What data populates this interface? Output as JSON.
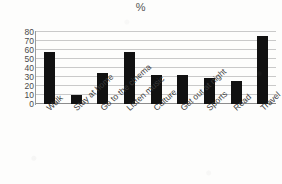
{
  "chart_data": {
    "type": "bar",
    "title": "%",
    "xlabel": "",
    "ylabel": "",
    "ylim": [
      0,
      80
    ],
    "yticks": [
      0,
      10,
      20,
      30,
      40,
      50,
      60,
      70,
      80
    ],
    "grid": true,
    "legend": "none",
    "categories": [
      "Walk",
      "Stay at home",
      "Go to the cinema",
      "Listen music",
      "Culture",
      "Get out at night",
      "Sports",
      "Read",
      "Travel"
    ],
    "values": [
      58,
      10,
      34,
      58,
      32,
      32,
      29,
      26,
      76
    ],
    "series": [
      {
        "name": "%",
        "values": [
          58,
          10,
          34,
          58,
          32,
          32,
          29,
          26,
          76
        ]
      }
    ],
    "colors": {
      "bar": "#111111",
      "gridline": "#c9c9c9",
      "axis": "#8c8c8c",
      "background": "#fdfdfc",
      "tick_text": "#4a4a4a"
    }
  }
}
